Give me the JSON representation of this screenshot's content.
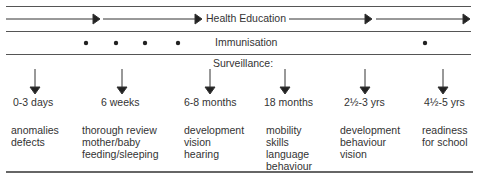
{
  "bands": {
    "health_education": "Health Education",
    "immunisation": "Immunisation",
    "surveillance": "Surveillance:"
  },
  "stages": [
    {
      "age": "0-3 days",
      "items": [
        "anomalies",
        "defects"
      ]
    },
    {
      "age": "6 weeks",
      "items": [
        "thorough review",
        "mother/baby",
        "feeding/sleeping"
      ]
    },
    {
      "age": "6-8 months",
      "items": [
        "development",
        "vision",
        "hearing"
      ]
    },
    {
      "age": "18 months",
      "items": [
        "mobility",
        "skills",
        "language",
        "behaviour"
      ]
    },
    {
      "age": "2½-3 yrs",
      "items": [
        "development",
        "behaviour",
        "vision"
      ]
    },
    {
      "age": "4½-5 yrs",
      "items": [
        "readiness",
        "for school"
      ]
    }
  ]
}
